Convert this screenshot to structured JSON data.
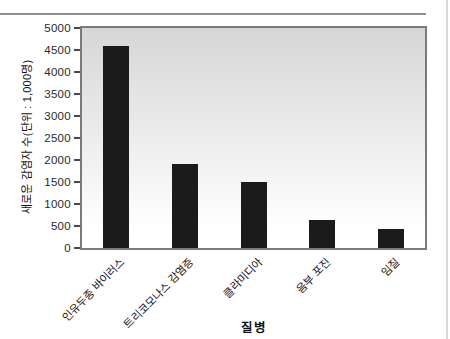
{
  "chart_data": {
    "type": "bar",
    "title": "",
    "xlabel": "질병",
    "ylabel": "새로운 감염자 수(단위 : 1,000명)",
    "categories": [
      "인유두종 바이러스",
      "트리코모나스 감염증",
      "클라미디아",
      "음부 포진",
      "임질"
    ],
    "values": [
      4600,
      1900,
      1500,
      640,
      430
    ],
    "ylim": [
      0,
      5000
    ],
    "ytick_step": 500,
    "yticks": [
      0,
      500,
      1000,
      1500,
      2000,
      2500,
      3000,
      3500,
      4000,
      4500,
      5000
    ],
    "grid": false,
    "legend": null,
    "bar_color": "#1b1b1b",
    "plot_bg_top": "#d6d6d6",
    "plot_bg_bottom": "#ffffff",
    "frame_color": "#7a7a7a"
  }
}
